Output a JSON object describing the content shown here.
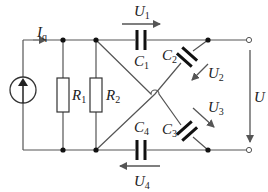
{
  "diagram": {
    "type": "circuit",
    "colors": {
      "wire": "#555555",
      "component": "#111111",
      "arrow": "#555555"
    },
    "source": {
      "current_label": "I",
      "current_sub": "q"
    },
    "resistors": [
      {
        "label": "R",
        "sub": "1"
      },
      {
        "label": "R",
        "sub": "2"
      }
    ],
    "capacitors": [
      {
        "label": "C",
        "sub": "1",
        "voltage": "U",
        "voltage_sub": "1"
      },
      {
        "label": "C",
        "sub": "2",
        "voltage": "U",
        "voltage_sub": "2"
      },
      {
        "label": "C",
        "sub": "3",
        "voltage": "U",
        "voltage_sub": "3"
      },
      {
        "label": "C",
        "sub": "4",
        "voltage": "U",
        "voltage_sub": "4"
      }
    ],
    "output": {
      "voltage_label": "U"
    }
  }
}
